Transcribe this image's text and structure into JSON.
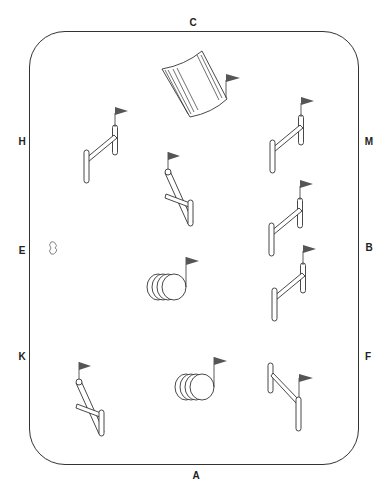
{
  "diagram": {
    "arena_markers": [
      {
        "id": "C",
        "label": "C",
        "x": 193,
        "y": 22
      },
      {
        "id": "A",
        "label": "A",
        "x": 196,
        "y": 475
      },
      {
        "id": "H",
        "label": "H",
        "x": 22,
        "y": 141
      },
      {
        "id": "E",
        "label": "E",
        "x": 22,
        "y": 250
      },
      {
        "id": "K",
        "label": "K",
        "x": 22,
        "y": 356
      },
      {
        "id": "M",
        "label": "M",
        "x": 369,
        "y": 141
      },
      {
        "id": "B",
        "label": "B",
        "x": 369,
        "y": 247
      },
      {
        "id": "F",
        "label": "F",
        "x": 368,
        "y": 356
      }
    ],
    "obstacles": [
      {
        "type": "liverpool-water-jump",
        "x": 200,
        "y": 95
      },
      {
        "type": "vertical-fence",
        "location": "near H"
      },
      {
        "type": "x-cross-fence",
        "location": "center upper"
      },
      {
        "type": "vertical-fence",
        "location": "near M"
      },
      {
        "type": "vertical-fence",
        "location": "near B upper"
      },
      {
        "type": "vertical-fence",
        "location": "near B lower"
      },
      {
        "type": "barrel-jump",
        "location": "center"
      },
      {
        "type": "x-cross-fence",
        "location": "near K"
      },
      {
        "type": "barrel-jump",
        "location": "near A"
      },
      {
        "type": "vertical-fence",
        "location": "near F"
      },
      {
        "type": "rider-start-marker",
        "location": "near E"
      }
    ],
    "colors": {
      "line": "#333333",
      "flag": "#555555",
      "background": "#ffffff"
    }
  }
}
